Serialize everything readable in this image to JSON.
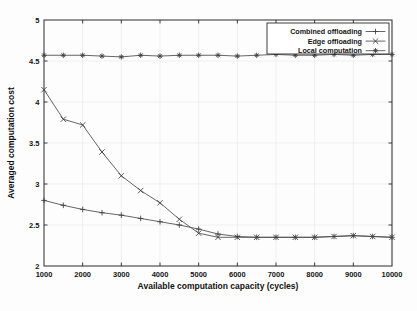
{
  "chart_data": {
    "type": "line",
    "title": "",
    "xlabel": "Available computation capacity (cycles)",
    "ylabel": "Averaged computation cost",
    "xlim": [
      1000,
      10000
    ],
    "ylim": [
      2,
      5
    ],
    "xticks": [
      1000,
      2000,
      3000,
      4000,
      5000,
      6000,
      7000,
      8000,
      9000,
      10000
    ],
    "xtick_labels": [
      "1000",
      "2000",
      "3000",
      "4000",
      "5000",
      "6000",
      "7000",
      "8000",
      "9000",
      "10000"
    ],
    "yticks": [
      2,
      2.5,
      3,
      3.5,
      4,
      4.5,
      5
    ],
    "ytick_labels": [
      "2",
      "2.5",
      "3",
      "3.5",
      "4",
      "4.5",
      "5"
    ],
    "grid": true,
    "legend_position": "top-right",
    "x": [
      1000,
      1500,
      2000,
      2500,
      3000,
      3500,
      4000,
      4500,
      5000,
      5500,
      6000,
      6500,
      7000,
      7500,
      8000,
      8500,
      9000,
      9500,
      10000
    ],
    "series": [
      {
        "name": "Combined offloading",
        "marker": "plus",
        "values": [
          2.8,
          2.74,
          2.69,
          2.65,
          2.62,
          2.58,
          2.54,
          2.5,
          2.45,
          2.39,
          2.36,
          2.35,
          2.35,
          2.35,
          2.35,
          2.36,
          2.37,
          2.36,
          2.35
        ]
      },
      {
        "name": "Edge offloading",
        "marker": "cross",
        "values": [
          4.15,
          3.79,
          3.72,
          3.39,
          3.1,
          2.92,
          2.77,
          2.57,
          2.4,
          2.35,
          2.35,
          2.35,
          2.35,
          2.35,
          2.35,
          2.36,
          2.37,
          2.36,
          2.35
        ]
      },
      {
        "name": "Local computation",
        "marker": "star",
        "values": [
          4.57,
          4.57,
          4.57,
          4.56,
          4.55,
          4.57,
          4.56,
          4.57,
          4.57,
          4.57,
          4.56,
          4.57,
          4.58,
          4.57,
          4.57,
          4.58,
          4.57,
          4.58,
          4.58
        ]
      }
    ]
  },
  "legend": {
    "items": [
      {
        "label": "Combined offloading"
      },
      {
        "label": "Edge offloading"
      },
      {
        "label": "Local computation"
      }
    ]
  },
  "colors": {
    "axis": "#2b2b2b",
    "series": "#4a4a4a",
    "grid": "#e9e9e9",
    "background": "#fdfdfd"
  }
}
